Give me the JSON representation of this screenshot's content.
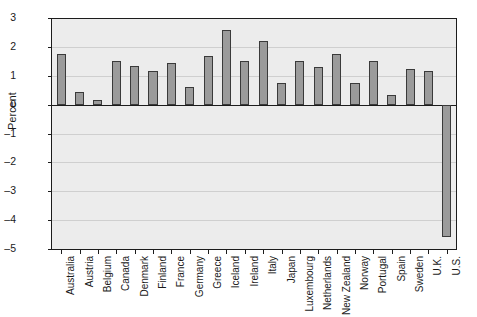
{
  "chart_data": {
    "type": "bar",
    "title": "",
    "xlabel": "",
    "ylabel": "Percent",
    "ylim": [
      -5,
      3
    ],
    "yticks": [
      3,
      2,
      1,
      0,
      -1,
      -2,
      -3,
      -4,
      -5
    ],
    "ytick_labels": [
      "3",
      "2",
      "1",
      "0",
      "–1",
      "–2",
      "–3",
      "–4",
      "–5"
    ],
    "grid": true,
    "legend": null,
    "bar_color": "#9b9b9b",
    "bar_edge_color": "#3a3a3a",
    "plot_background": "#ececec",
    "categories": [
      "Australia",
      "Austria",
      "Belgium",
      "Canada",
      "Denmark",
      "Finland",
      "France",
      "Germany",
      "Greece",
      "Iceland",
      "Ireland",
      "Italy",
      "Japan",
      "Luxembourg",
      "Netherlands",
      "New Zealand",
      "Norway",
      "Portugal",
      "Spain",
      "Sweden",
      "U.K.",
      "U.S."
    ],
    "values": [
      1.75,
      0.45,
      0.15,
      1.5,
      1.35,
      1.15,
      1.45,
      0.6,
      1.7,
      2.6,
      1.5,
      2.2,
      0.75,
      1.5,
      1.3,
      1.75,
      0.75,
      1.5,
      0.35,
      1.25,
      1.15,
      -4.6
    ]
  }
}
